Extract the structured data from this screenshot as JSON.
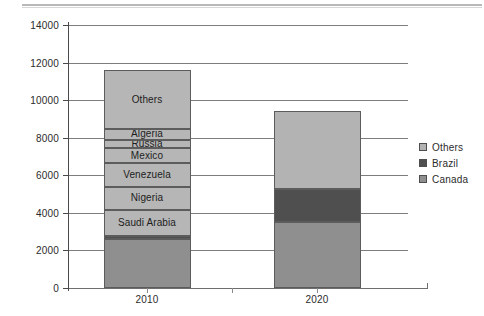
{
  "chart_data": {
    "type": "bar",
    "title": "",
    "xlabel": "",
    "ylabel": "",
    "categories": [
      "2010",
      "2020"
    ],
    "ylim": [
      0,
      14000
    ],
    "ytick_step": 2000,
    "yticks": [
      "0",
      "2000",
      "4000",
      "6000",
      "8000",
      "10000",
      "12000",
      "14000"
    ],
    "grid": true,
    "stacked": true,
    "legend_position": "right",
    "legend": [
      {
        "label": "Others",
        "color": "#b3b3b3"
      },
      {
        "label": "Brazil",
        "color": "#4f4f4f"
      },
      {
        "label": "Canada",
        "color": "#8f8f8f"
      }
    ],
    "colors": {
      "others": "#b3b3b3",
      "brazil": "#4f4f4f",
      "canada": "#8f8f8f",
      "labelled_segment": "#b6b6b6",
      "segment_border": "#5c5c5c",
      "gridline": "#7d7d7d",
      "axis": "#4a4a4a",
      "text": "#2b2b2b"
    },
    "totals": {
      "2010": 11600,
      "2020": 9400
    },
    "series": [
      {
        "name": "2010",
        "total": 11600,
        "segments": [
          {
            "label": "Canada",
            "value": 2600,
            "y0": 0,
            "y1": 2600,
            "color": "#8f8f8f",
            "show_label": false
          },
          {
            "label": "Brazil",
            "value": 150,
            "y0": 2600,
            "y1": 2750,
            "color": "#4f4f4f",
            "show_label": false
          },
          {
            "label": "Saudi Arabia",
            "value": 1400,
            "y0": 2750,
            "y1": 4150,
            "color": "#b6b6b6",
            "show_label": true
          },
          {
            "label": "Nigeria",
            "value": 1250,
            "y0": 4150,
            "y1": 5400,
            "color": "#b6b6b6",
            "show_label": true
          },
          {
            "label": "Venezuela",
            "value": 1250,
            "y0": 5400,
            "y1": 6650,
            "color": "#b6b6b6",
            "show_label": true
          },
          {
            "label": "Mexico",
            "value": 800,
            "y0": 6650,
            "y1": 7450,
            "color": "#b6b6b6",
            "show_label": true
          },
          {
            "label": "Russia",
            "value": 450,
            "y0": 7450,
            "y1": 7900,
            "color": "#b6b6b6",
            "show_label": true
          },
          {
            "label": "Algeria",
            "value": 550,
            "y0": 7900,
            "y1": 8450,
            "color": "#b6b6b6",
            "show_label": true
          },
          {
            "label": "Others",
            "value": 3150,
            "y0": 8450,
            "y1": 11600,
            "color": "#b6b6b6",
            "show_label": true
          }
        ]
      },
      {
        "name": "2020",
        "total": 9400,
        "segments": [
          {
            "label": "Canada",
            "value": 3500,
            "y0": 0,
            "y1": 3500,
            "color": "#8f8f8f",
            "show_label": false
          },
          {
            "label": "Brazil",
            "value": 1750,
            "y0": 3500,
            "y1": 5250,
            "color": "#4f4f4f",
            "show_label": false
          },
          {
            "label": "Others",
            "value": 4150,
            "y0": 5250,
            "y1": 9400,
            "color": "#b3b3b3",
            "show_label": false
          }
        ]
      }
    ]
  }
}
